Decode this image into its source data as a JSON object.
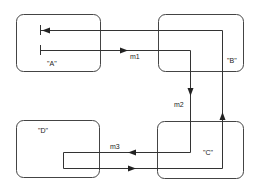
{
  "diagram": {
    "type": "message-sequence / component interaction",
    "nodes": [
      {
        "id": "A",
        "label": "\"A\""
      },
      {
        "id": "B",
        "label": "\"B\""
      },
      {
        "id": "C",
        "label": "\"C\""
      },
      {
        "id": "D",
        "label": "\"D\""
      }
    ],
    "messages": [
      {
        "id": "m1",
        "label": "m1",
        "from": "A",
        "to": "C"
      },
      {
        "id": "m2",
        "label": "m2",
        "from": "C",
        "to": "D"
      },
      {
        "id": "m3",
        "label": "m3",
        "from": "D",
        "to": "B"
      }
    ],
    "return_path": {
      "from": "B",
      "to": "A"
    },
    "colors": {
      "stroke": "#333333",
      "background": "#ffffff"
    }
  }
}
